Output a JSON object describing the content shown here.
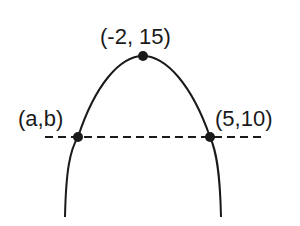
{
  "diagram": {
    "type": "parabola",
    "colors": {
      "stroke": "#1a1a1a",
      "background": "#ffffff"
    },
    "points": [
      {
        "id": "vertex",
        "label": "(-2, 15)",
        "x": -2,
        "y": 15
      },
      {
        "id": "left",
        "label": "(a,b)"
      },
      {
        "id": "right",
        "label": "(5,10)",
        "x": 5,
        "y": 10
      }
    ],
    "dashed_line": {
      "description": "horizontal line through (a,b) and (5,10)"
    }
  }
}
